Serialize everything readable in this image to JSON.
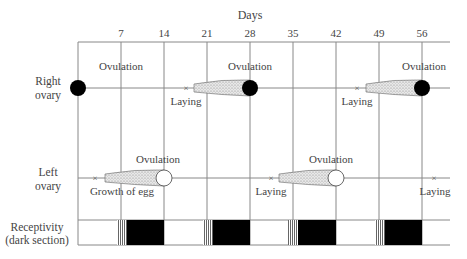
{
  "diagram": {
    "title": "Days",
    "day_ticks": [
      "7",
      "14",
      "21",
      "28",
      "35",
      "42",
      "49",
      "56"
    ],
    "rows": {
      "right_ovary": {
        "label_line1": "Right",
        "label_line2": "ovary"
      },
      "left_ovary": {
        "label_line1": "Left",
        "label_line2": "ovary"
      },
      "receptivity": {
        "label_line1": "Receptivity",
        "label_line2": "(dark section)"
      }
    },
    "annotations": {
      "right": [
        {
          "text": "Ovulation",
          "day": 7
        },
        {
          "text": "Laying",
          "day": 17
        },
        {
          "text": "Ovulation",
          "day": 28
        },
        {
          "text": "Laying",
          "day": 45
        },
        {
          "text": "Ovulation",
          "day": 56
        }
      ],
      "left": [
        {
          "text": "Ovulation",
          "day": 15
        },
        {
          "text": "Growth of egg",
          "day": 7
        },
        {
          "text": "Laying",
          "day": 31
        },
        {
          "text": "Ovulation",
          "day": 38
        },
        {
          "text": "Laying",
          "day": 56
        }
      ]
    },
    "receptive_periods": [
      {
        "striped_start": 7,
        "dark_start": 8.5,
        "end": 14
      },
      {
        "striped_start": 21,
        "dark_start": 22.5,
        "end": 28
      },
      {
        "striped_start": 35,
        "dark_start": 36.5,
        "end": 42
      },
      {
        "striped_start": 49,
        "dark_start": 50.5,
        "end": 56
      }
    ],
    "colors": {
      "line": "#888888",
      "egg_dark": "#000000",
      "egg_light": "#ffffff",
      "stipple": "#bbbbbb"
    }
  }
}
